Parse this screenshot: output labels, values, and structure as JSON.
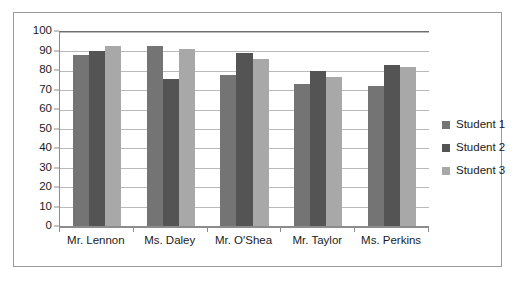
{
  "chart_data": {
    "type": "bar",
    "title": "",
    "xlabel": "",
    "ylabel": "",
    "ylim": [
      0,
      100
    ],
    "ytick_step": 10,
    "yticks": [
      100,
      90,
      80,
      70,
      60,
      50,
      40,
      30,
      20,
      10,
      0
    ],
    "grid": true,
    "legend_position": "right",
    "categories": [
      "Mr. Lennon",
      "Ms. Daley",
      "Mr. O'Shea",
      "Mr. Taylor",
      "Ms. Perkins"
    ],
    "series": [
      {
        "name": "Student 1",
        "color": "#747474",
        "values": [
          88,
          93,
          78,
          73,
          72
        ]
      },
      {
        "name": "Student 2",
        "color": "#545454",
        "values": [
          90,
          76,
          89,
          80,
          83
        ]
      },
      {
        "name": "Student 3",
        "color": "#a8a8a8",
        "values": [
          93,
          91,
          86,
          77,
          82
        ]
      }
    ]
  },
  "legend": {
    "items": [
      {
        "label": "Student 1",
        "color": "#747474"
      },
      {
        "label": "Student 2",
        "color": "#545454"
      },
      {
        "label": "Student 3",
        "color": "#a8a8a8"
      }
    ]
  },
  "colors": {
    "frame": "#9a9a9a",
    "gridline": "#b9b9b9",
    "axis": "#8c8c8c",
    "text": "#1b1b1b",
    "background": "#ffffff"
  }
}
